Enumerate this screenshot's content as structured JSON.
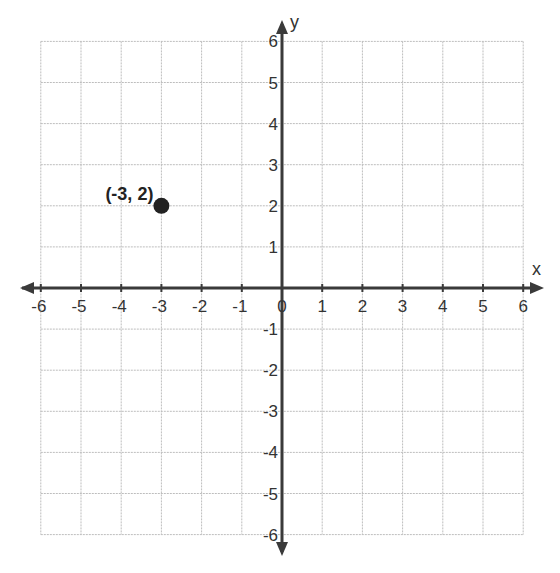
{
  "chart_data": {
    "type": "scatter",
    "title": "",
    "xlabel": "x",
    "ylabel": "y",
    "xlim": [
      -6,
      6
    ],
    "ylim": [
      -6,
      6
    ],
    "grid": true,
    "x_ticks": [
      -6,
      -5,
      -4,
      -3,
      -2,
      -1,
      0,
      1,
      2,
      3,
      4,
      5,
      6
    ],
    "y_ticks": [
      -6,
      -5,
      -4,
      -3,
      -2,
      -1,
      1,
      2,
      3,
      4,
      5,
      6
    ],
    "series": [
      {
        "name": "point",
        "points": [
          {
            "x": -3,
            "y": 2,
            "label": "(-3, 2)"
          }
        ],
        "color": "#222222"
      }
    ]
  },
  "style": {
    "grid_color": "#bdbdbd",
    "axis_color": "#3a3a3a",
    "point_color": "#222222"
  }
}
